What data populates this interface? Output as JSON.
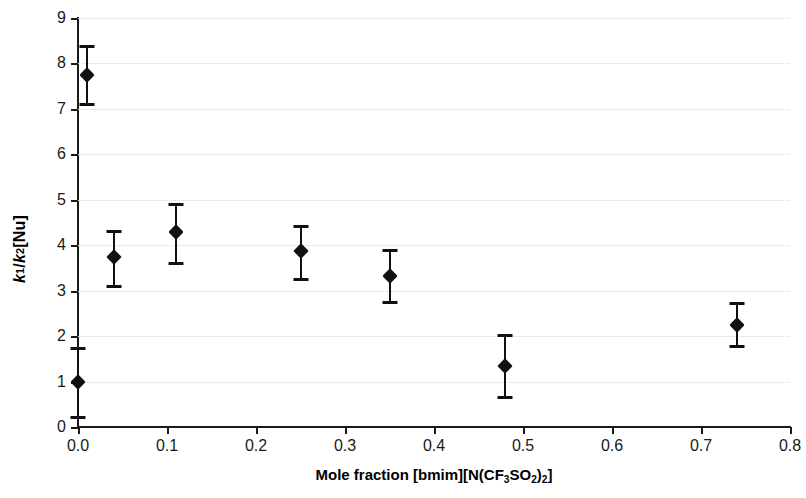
{
  "chart_data": {
    "type": "scatter",
    "title": "",
    "xlabel": "Mole fraction [bmim][N(CF3SO2)2]",
    "xlabel_parts": {
      "prefix": "Mole fraction [bmim][N(CF",
      "sub1": "3",
      "mid": "SO",
      "sub2": "2",
      "mid2": ")",
      "sub3": "2",
      "suffix": "]"
    },
    "ylabel": "k1 / k2[Nu]",
    "ylabel_parts": {
      "k1": "k",
      "k1sub": "1",
      "slash": " / ",
      "k2": "k",
      "k2sub": "2",
      "nu": "[Nu]"
    },
    "xlim": [
      0.0,
      0.8
    ],
    "ylim": [
      0,
      9
    ],
    "xticks": [
      "0.0",
      "0.1",
      "0.2",
      "0.3",
      "0.4",
      "0.5",
      "0.6",
      "0.7",
      "0.8"
    ],
    "xtick_values": [
      0.0,
      0.1,
      0.2,
      0.3,
      0.4,
      0.5,
      0.6,
      0.7,
      0.8
    ],
    "yticks": [
      "0",
      "1",
      "2",
      "3",
      "4",
      "5",
      "6",
      "7",
      "8",
      "9"
    ],
    "ytick_values": [
      0,
      1,
      2,
      3,
      4,
      5,
      6,
      7,
      8,
      9
    ],
    "grid": "horizontal-dotted",
    "legend": null,
    "marker_style": "filled-diamond",
    "marker_color": "#111111",
    "errorbar_color": "#111111",
    "gridline_color": "#d9d9d9",
    "axis_color": "#1a1a1a",
    "x": [
      0.0,
      0.01,
      0.04,
      0.11,
      0.25,
      0.35,
      0.48,
      0.74
    ],
    "y": [
      1.0,
      7.75,
      3.75,
      4.3,
      3.87,
      3.33,
      1.35,
      2.25
    ],
    "yerr_low": [
      0.25,
      7.12,
      3.12,
      3.63,
      3.27,
      2.78,
      0.68,
      1.8
    ],
    "yerr_high": [
      1.75,
      8.4,
      4.33,
      4.93,
      4.45,
      3.92,
      2.05,
      2.75
    ],
    "points": [
      {
        "x": 0.0,
        "y": 1.0,
        "low": 0.25,
        "high": 1.75
      },
      {
        "x": 0.01,
        "y": 7.75,
        "low": 7.12,
        "high": 8.4
      },
      {
        "x": 0.04,
        "y": 3.75,
        "low": 3.12,
        "high": 4.33
      },
      {
        "x": 0.11,
        "y": 4.3,
        "low": 3.63,
        "high": 4.93
      },
      {
        "x": 0.25,
        "y": 3.87,
        "low": 3.27,
        "high": 4.45
      },
      {
        "x": 0.35,
        "y": 3.33,
        "low": 2.78,
        "high": 3.92
      },
      {
        "x": 0.48,
        "y": 1.35,
        "low": 0.68,
        "high": 2.05
      },
      {
        "x": 0.74,
        "y": 2.25,
        "low": 1.8,
        "high": 2.75
      }
    ]
  }
}
